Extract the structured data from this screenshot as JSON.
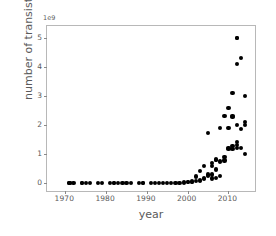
{
  "chart_data": {
    "type": "scatter",
    "title": "",
    "xlabel": "year",
    "ylabel": "number of transistors",
    "y_offset_text": "1e9",
    "y_scale": 1000000000,
    "xlim": [
      1965.5,
      2016.5
    ],
    "ylim": [
      -0.28,
      5.42
    ],
    "xticks": [
      1970,
      1980,
      1990,
      2000,
      2010
    ],
    "xticklabels": [
      "1970",
      "1980",
      "1990",
      "2000",
      "2010"
    ],
    "yticks": [
      0,
      1,
      2,
      3,
      4,
      5
    ],
    "yticklabels": [
      "0",
      "1",
      "2",
      "3",
      "4",
      "5"
    ],
    "grid": false,
    "legend": null,
    "marker": "circle",
    "marker_color": "#000000",
    "marker_size": 4.2,
    "points": [
      {
        "x": 1971,
        "y": 2.3e-06
      },
      {
        "x": 1971,
        "y": 2.5e-06
      },
      {
        "x": 1972,
        "y": 3.5e-06
      },
      {
        "x": 1974,
        "y": 4.5e-06
      },
      {
        "x": 1974,
        "y": 5e-06
      },
      {
        "x": 1975,
        "y": 8e-06
      },
      {
        "x": 1976,
        "y": 8e-06
      },
      {
        "x": 1978,
        "y": 2.9e-05
      },
      {
        "x": 1979,
        "y": 2.9e-05
      },
      {
        "x": 1981,
        "y": 5.5e-05
      },
      {
        "x": 1982,
        "y": 0.000134
      },
      {
        "x": 1982,
        "y": 6.8e-05
      },
      {
        "x": 1983,
        "y": 0.0001
      },
      {
        "x": 1984,
        "y": 0.00019
      },
      {
        "x": 1985,
        "y": 0.000275
      },
      {
        "x": 1986,
        "y": 0.00027
      },
      {
        "x": 1988,
        "y": 0.000275
      },
      {
        "x": 1989,
        "y": 0.0012
      },
      {
        "x": 1989,
        "y": 0.0011
      },
      {
        "x": 1991,
        "y": 0.0013
      },
      {
        "x": 1992,
        "y": 0.0011
      },
      {
        "x": 1993,
        "y": 0.0031
      },
      {
        "x": 1994,
        "y": 0.0032
      },
      {
        "x": 1995,
        "y": 0.0059
      },
      {
        "x": 1996,
        "y": 0.0043
      },
      {
        "x": 1997,
        "y": 0.0075
      },
      {
        "x": 1998,
        "y": 0.0076
      },
      {
        "x": 1999,
        "y": 0.0095
      },
      {
        "x": 1999,
        "y": 0.0215
      },
      {
        "x": 2000,
        "y": 0.0222
      },
      {
        "x": 2000,
        "y": 0.042
      },
      {
        "x": 2001,
        "y": 0.025
      },
      {
        "x": 2001,
        "y": 0.045
      },
      {
        "x": 2002,
        "y": 0.055
      },
      {
        "x": 2002,
        "y": 0.22
      },
      {
        "x": 2003,
        "y": 0.054
      },
      {
        "x": 2003,
        "y": 0.106
      },
      {
        "x": 2003,
        "y": 0.41
      },
      {
        "x": 2004,
        "y": 0.125
      },
      {
        "x": 2004,
        "y": 0.169
      },
      {
        "x": 2004,
        "y": 0.592
      },
      {
        "x": 2005,
        "y": 0.228
      },
      {
        "x": 2005,
        "y": 0.291
      },
      {
        "x": 2005,
        "y": 1.72
      },
      {
        "x": 2006,
        "y": 0.152
      },
      {
        "x": 2006,
        "y": 0.291
      },
      {
        "x": 2006,
        "y": 0.596
      },
      {
        "x": 2006,
        "y": 0.69
      },
      {
        "x": 2007,
        "y": 0.169
      },
      {
        "x": 2007,
        "y": 0.463
      },
      {
        "x": 2007,
        "y": 0.789
      },
      {
        "x": 2007,
        "y": 0.805
      },
      {
        "x": 2008,
        "y": 0.228
      },
      {
        "x": 2008,
        "y": 0.731
      },
      {
        "x": 2008,
        "y": 0.758
      },
      {
        "x": 2008,
        "y": 1.9
      },
      {
        "x": 2009,
        "y": 0.774
      },
      {
        "x": 2009,
        "y": 0.904
      },
      {
        "x": 2009,
        "y": 2.3
      },
      {
        "x": 2010,
        "y": 1.17
      },
      {
        "x": 2010,
        "y": 1.2
      },
      {
        "x": 2010,
        "y": 1.9
      },
      {
        "x": 2010,
        "y": 2.6
      },
      {
        "x": 2011,
        "y": 1.16
      },
      {
        "x": 2011,
        "y": 1.27
      },
      {
        "x": 2011,
        "y": 2.27
      },
      {
        "x": 2011,
        "y": 2.3
      },
      {
        "x": 2011,
        "y": 3.1
      },
      {
        "x": 2012,
        "y": 1.2
      },
      {
        "x": 2012,
        "y": 1.3
      },
      {
        "x": 2012,
        "y": 1.4
      },
      {
        "x": 2012,
        "y": 2.0
      },
      {
        "x": 2012,
        "y": 4.1
      },
      {
        "x": 2012,
        "y": 5.0
      },
      {
        "x": 2012,
        "y": 5.0
      },
      {
        "x": 2013,
        "y": 1.2
      },
      {
        "x": 2013,
        "y": 1.86
      },
      {
        "x": 2013,
        "y": 4.31
      },
      {
        "x": 2014,
        "y": 1.0
      },
      {
        "x": 2014,
        "y": 2.0
      },
      {
        "x": 2014,
        "y": 3.0
      },
      {
        "x": 2014,
        "y": 2.1
      }
    ]
  }
}
